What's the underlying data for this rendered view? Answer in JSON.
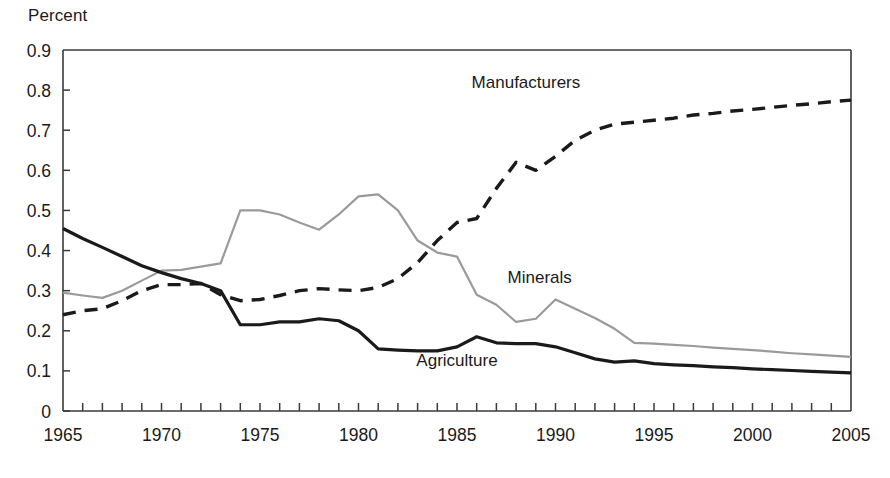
{
  "chart_data": {
    "type": "line",
    "title": "",
    "ylabel": "Percent",
    "xlabel": "",
    "ylim": [
      0,
      0.9
    ],
    "xlim": [
      1965,
      2005
    ],
    "ytick_labels": [
      "0.9",
      "0.8",
      "0.7",
      "0.6",
      "0.5",
      "0.4",
      "0.3",
      "0.2",
      "0.1",
      "0"
    ],
    "ytick_values": [
      0.9,
      0.8,
      0.7,
      0.6,
      0.5,
      0.4,
      0.3,
      0.2,
      0.1,
      0
    ],
    "xtick_labels": [
      "1965",
      "1970",
      "1975",
      "1980",
      "1985",
      "1990",
      "1995",
      "2000",
      "2005"
    ],
    "xtick_values": [
      1965,
      1970,
      1975,
      1980,
      1985,
      1990,
      1995,
      2000,
      2005
    ],
    "minor_tick_interval": 1,
    "grid": false,
    "legend": "inline-annotations",
    "x": [
      1965,
      1966,
      1967,
      1968,
      1969,
      1970,
      1971,
      1972,
      1973,
      1974,
      1975,
      1976,
      1977,
      1978,
      1979,
      1980,
      1981,
      1982,
      1983,
      1984,
      1985,
      1986,
      1987,
      1988,
      1989,
      1990,
      1991,
      1992,
      1993,
      1994,
      1995,
      1996,
      1997,
      1998,
      1999,
      2000,
      2001,
      2002,
      2003,
      2004,
      2005
    ],
    "series": [
      {
        "name": "Manufacturers",
        "style": "dashed",
        "color": "#1a1a1a",
        "label_x": 1988.5,
        "label_y": 0.805,
        "values": [
          0.24,
          0.25,
          0.255,
          0.275,
          0.3,
          0.315,
          0.315,
          0.318,
          0.29,
          0.275,
          0.278,
          0.288,
          0.3,
          0.305,
          0.302,
          0.3,
          0.308,
          0.33,
          0.37,
          0.425,
          0.47,
          0.48,
          0.555,
          0.62,
          0.6,
          0.635,
          0.675,
          0.7,
          0.715,
          0.72,
          0.725,
          0.73,
          0.738,
          0.742,
          0.748,
          0.752,
          0.757,
          0.762,
          0.766,
          0.771,
          0.775
        ]
      },
      {
        "name": "Minerals",
        "style": "solid",
        "color": "#9a9a9a",
        "label_x": 1989.2,
        "label_y": 0.318,
        "values": [
          0.295,
          0.288,
          0.282,
          0.3,
          0.325,
          0.35,
          0.352,
          0.36,
          0.368,
          0.5,
          0.5,
          0.49,
          0.47,
          0.452,
          0.49,
          0.535,
          0.54,
          0.5,
          0.425,
          0.395,
          0.385,
          0.29,
          0.265,
          0.222,
          0.23,
          0.278,
          0.255,
          0.232,
          0.205,
          0.17,
          0.168,
          0.165,
          0.162,
          0.158,
          0.155,
          0.152,
          0.148,
          0.144,
          0.141,
          0.138,
          0.135
        ]
      },
      {
        "name": "Agriculture",
        "style": "solid",
        "color": "#1a1a1a",
        "label_x": 1985.0,
        "label_y": 0.112,
        "values": [
          0.455,
          0.43,
          0.408,
          0.385,
          0.362,
          0.345,
          0.33,
          0.318,
          0.3,
          0.215,
          0.215,
          0.222,
          0.222,
          0.23,
          0.225,
          0.2,
          0.155,
          0.152,
          0.15,
          0.15,
          0.16,
          0.185,
          0.17,
          0.168,
          0.168,
          0.16,
          0.145,
          0.13,
          0.122,
          0.125,
          0.118,
          0.115,
          0.113,
          0.11,
          0.108,
          0.105,
          0.103,
          0.101,
          0.099,
          0.097,
          0.095
        ]
      }
    ]
  }
}
